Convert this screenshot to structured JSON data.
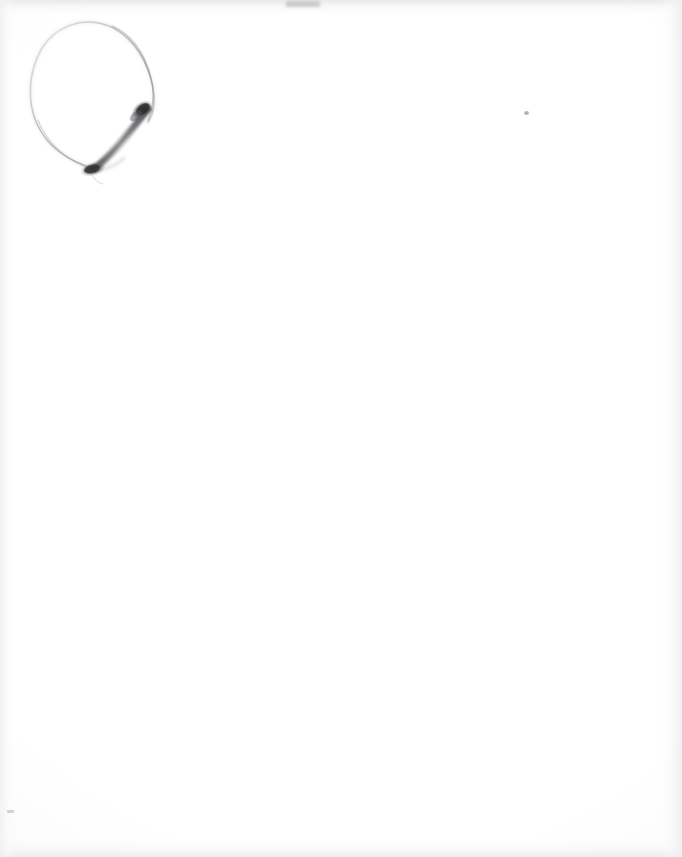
{
  "document": {
    "kind": "scanned-paper-sheet",
    "title": "Pencil sketch on blank paper",
    "caption": "A near-blank white scanned sheet with a single faint graphite drawing in the upper-left corner.",
    "page_width": 682,
    "page_height": 857,
    "orientation": "portrait"
  },
  "paper": {
    "base_color": "#fefefe",
    "center_color": "#ffffff",
    "edge_tint_color": "#f1f1f3",
    "top_edge_color": "#e8e8ea",
    "bottom_edge_color": "#ececee",
    "left_edge_color": "#f0f0f2",
    "right_edge_color": "#efeff1"
  },
  "sketch": {
    "name": "balloon-loop-with-stroke",
    "description": "A large faint teardrop / balloon shaped closed loop drawn in very light pencil, with a short dark tapered graphite stroke running diagonally across its lower interior.",
    "position": {
      "x": 28,
      "y": 18,
      "width": 130,
      "height": 165
    },
    "loop": {
      "name": "faint-loop-outline",
      "stroke_color": "#c9c9cd",
      "stroke_color_dark": "#9a9aa0",
      "stroke_width": 1.4,
      "opacity": 0.85
    },
    "dark_stroke": {
      "name": "dark-tapered-stroke",
      "stroke_color": "#3c3c3e",
      "mid_color": "#6e6e72",
      "light_color": "#a8a8ac",
      "start": {
        "x": 93,
        "y": 170
      },
      "end": {
        "x": 150,
        "y": 104
      },
      "max_width": 10
    },
    "blob_upper": {
      "name": "dark-blob-upper",
      "color": "#323234",
      "center": {
        "x": 142,
        "y": 110
      },
      "width": 22,
      "height": 16
    },
    "blob_lower": {
      "name": "dark-blob-lower",
      "color": "#3a3a3c",
      "center": {
        "x": 93,
        "y": 169
      },
      "width": 24,
      "height": 13
    }
  },
  "artifacts": {
    "speck_right": {
      "name": "scan-speck-right",
      "x": 524,
      "y": 111,
      "color": "#969698"
    },
    "speck_left_low": {
      "name": "scan-speck-lower-left",
      "x": 7,
      "y": 810,
      "color": "#b6b6ba"
    },
    "smudge_top": {
      "name": "scan-smudge-top-edge",
      "x": 286,
      "y": 1,
      "color": "#bcbcc0"
    }
  }
}
